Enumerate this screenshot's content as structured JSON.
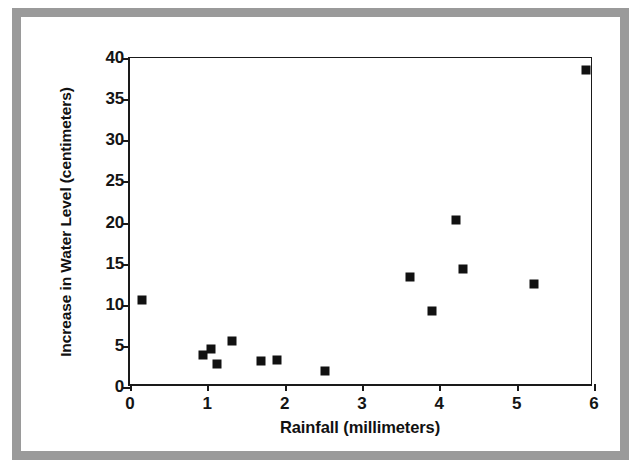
{
  "chart_data": {
    "type": "scatter",
    "title": "",
    "xlabel": "Rainfall (millimeters)",
    "ylabel": "Increase in Water Level (centimeters)",
    "xlim": [
      0,
      6
    ],
    "ylim": [
      0,
      40
    ],
    "xticks": [
      0,
      1,
      2,
      3,
      4,
      5,
      6
    ],
    "xtick_labels": [
      "0",
      "1",
      "2",
      "3",
      "4",
      "5",
      "6"
    ],
    "yticks": [
      0,
      5,
      10,
      15,
      20,
      25,
      30,
      35,
      40
    ],
    "ytick_labels": [
      "0",
      "5",
      "10",
      "15",
      "20",
      "25",
      "30",
      "35",
      "40"
    ],
    "grid": false,
    "legend": false,
    "marker": "square",
    "marker_color": "#111111",
    "points": [
      {
        "x": 0.15,
        "y": 10.6
      },
      {
        "x": 0.95,
        "y": 3.9
      },
      {
        "x": 1.05,
        "y": 4.6
      },
      {
        "x": 1.12,
        "y": 2.8
      },
      {
        "x": 1.32,
        "y": 5.6
      },
      {
        "x": 1.7,
        "y": 3.2
      },
      {
        "x": 1.9,
        "y": 3.3
      },
      {
        "x": 2.52,
        "y": 1.9
      },
      {
        "x": 3.62,
        "y": 13.4
      },
      {
        "x": 3.9,
        "y": 9.3
      },
      {
        "x": 4.22,
        "y": 20.3
      },
      {
        "x": 4.3,
        "y": 14.4
      },
      {
        "x": 5.22,
        "y": 12.5
      },
      {
        "x": 5.9,
        "y": 38.5
      }
    ]
  },
  "style": {
    "frame_color": "#9a9a9a",
    "axis_color": "#1a1a1a",
    "background": "#ffffff"
  }
}
